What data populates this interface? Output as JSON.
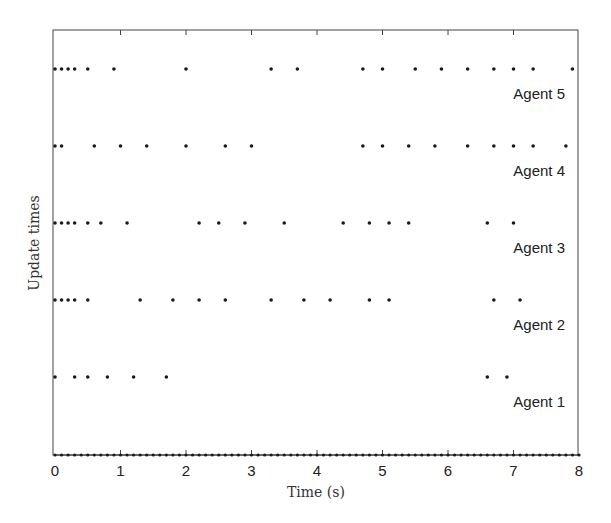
{
  "chart_data": {
    "type": "scatter",
    "title": "",
    "xlabel": "Time (s)",
    "ylabel": "Update times",
    "xlim": [
      0,
      8
    ],
    "x_ticks": [
      0,
      1,
      2,
      3,
      4,
      5,
      6,
      7,
      8
    ],
    "y_ticks": [],
    "grid": false,
    "legend": "none",
    "marker_color": "#1a1a1a",
    "series": [
      {
        "name": "Agent 5",
        "x": [
          0,
          0.1,
          0.2,
          0.3,
          0.5,
          0.9,
          2.0,
          3.3,
          3.7,
          4.7,
          5.0,
          5.5,
          5.9,
          6.3,
          6.7,
          7.0,
          7.3,
          7.9
        ]
      },
      {
        "name": "Agent 4",
        "x": [
          0,
          0.1,
          0.6,
          1.0,
          1.4,
          2.0,
          2.6,
          3.0,
          4.7,
          5.0,
          5.4,
          5.8,
          6.3,
          6.7,
          7.0,
          7.3,
          7.8
        ]
      },
      {
        "name": "Agent 3",
        "x": [
          0,
          0.1,
          0.2,
          0.3,
          0.5,
          0.7,
          1.1,
          2.2,
          2.5,
          2.9,
          3.5,
          4.4,
          4.8,
          5.1,
          5.4,
          6.6,
          7.0
        ]
      },
      {
        "name": "Agent 2",
        "x": [
          0,
          0.1,
          0.2,
          0.3,
          0.5,
          1.3,
          1.8,
          2.2,
          2.6,
          3.3,
          3.8,
          4.2,
          4.8,
          5.1,
          6.7,
          7.1
        ]
      },
      {
        "name": "Agent 1",
        "x": [
          0,
          0.3,
          0.5,
          0.8,
          1.2,
          1.7,
          6.6,
          6.9
        ]
      },
      {
        "name": "Baseline (sampling instants)",
        "x_start": 0,
        "x_end": 8,
        "x_step": 0.1
      }
    ]
  }
}
